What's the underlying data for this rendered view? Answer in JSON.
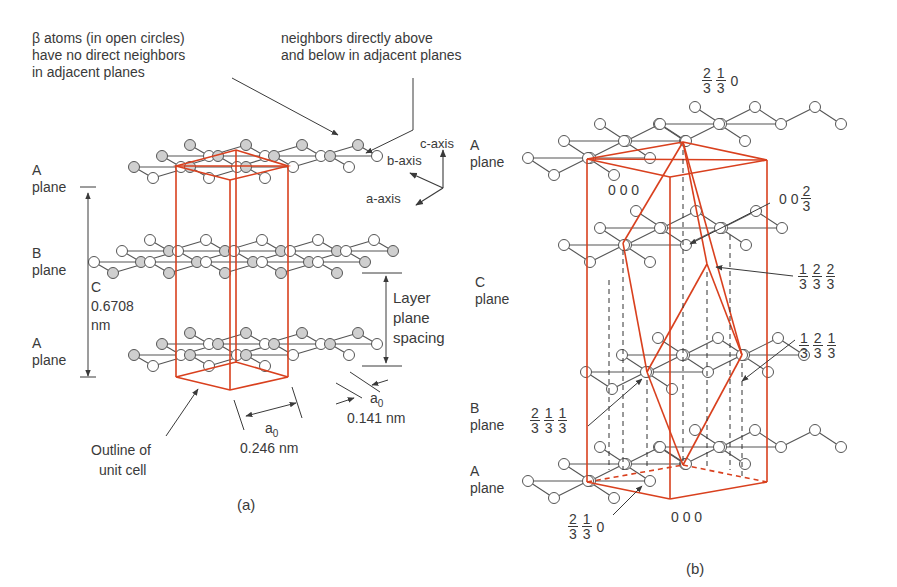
{
  "colors": {
    "red": "#d9401e",
    "bond": "#555555",
    "atom_gray": "#cfcfcf",
    "atom_open": "#ffffff",
    "atom_stroke": "#555555",
    "text": "#3a3a3a"
  },
  "panel_a": {
    "caption": "(a)",
    "annotations": {
      "beta_atoms": [
        "β atoms (in open circles)",
        "have no direct neighbors",
        "in adjacent planes"
      ],
      "alpha_atoms": [
        "neighbors directly above",
        "and below in adjacent planes"
      ],
      "axes": {
        "c": "c-axis",
        "b": "b-axis",
        "a": "a-axis"
      },
      "plane_labels": [
        {
          "letter": "A",
          "word": "plane"
        },
        {
          "letter": "B",
          "word": "plane"
        },
        {
          "letter": "A",
          "word": "plane"
        }
      ],
      "c_dimension": [
        "C",
        "0.6708",
        "nm"
      ],
      "layer_spacing": [
        "Layer",
        "plane",
        "spacing"
      ],
      "a0_label": "a",
      "a0_sub": "0",
      "a0_lattice": "0.246 nm",
      "a0_bond": "0.141 nm",
      "unit_cell": [
        "Outline of",
        "unit cell"
      ]
    }
  },
  "panel_b": {
    "caption": "(b)",
    "plane_labels": [
      {
        "letter": "A",
        "word": "plane"
      },
      {
        "letter": "C",
        "word": "plane"
      },
      {
        "letter": "B",
        "word": "plane"
      },
      {
        "letter": "A",
        "word": "plane"
      }
    ],
    "coordinates": [
      {
        "id": "top",
        "parts": [
          [
            "2",
            "3"
          ],
          [
            "1",
            "3"
          ],
          "0"
        ]
      },
      {
        "id": "origin_top",
        "parts": [
          "0 0 0"
        ]
      },
      {
        "id": "c23",
        "parts": [
          "0 0",
          [
            "2",
            "3"
          ]
        ]
      },
      {
        "id": "c_plane",
        "parts": [
          [
            "1",
            "3"
          ],
          [
            "2",
            "3"
          ],
          [
            "2",
            "3"
          ]
        ]
      },
      {
        "id": "b_plane_r",
        "parts": [
          [
            "1",
            "3"
          ],
          [
            "2",
            "3"
          ],
          [
            "1",
            "3"
          ]
        ]
      },
      {
        "id": "b_plane_l",
        "parts": [
          [
            "2",
            "3"
          ],
          [
            "1",
            "3"
          ],
          [
            "1",
            "3"
          ]
        ]
      },
      {
        "id": "bottom_l",
        "parts": [
          [
            "2",
            "3"
          ],
          [
            "1",
            "3"
          ],
          "0"
        ]
      },
      {
        "id": "origin_bottom",
        "parts": [
          "0 0 0"
        ]
      }
    ]
  }
}
